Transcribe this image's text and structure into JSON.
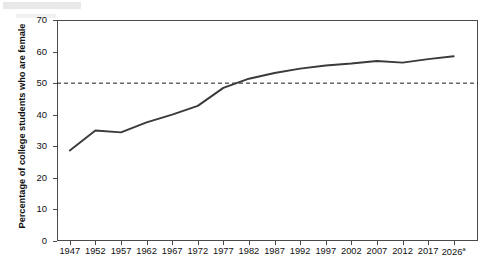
{
  "figure": {
    "background": "#ffffff",
    "axis_color": "#4a4a4a",
    "line_color": "#3a3a3a",
    "reference_line_color": "#1a1a1a"
  },
  "chart_data": {
    "type": "line",
    "title": "",
    "xlabel": "",
    "ylabel": "Percentage of college students who are female",
    "ylim": [
      0,
      70
    ],
    "ytick_values": [
      0,
      10,
      20,
      30,
      40,
      50,
      60,
      70
    ],
    "ytick_labels": [
      "0",
      "10",
      "20",
      "30",
      "40",
      "50",
      "60",
      "70"
    ],
    "xtick_labels": [
      "1947",
      "1952",
      "1957",
      "1962",
      "1967",
      "1972",
      "1977",
      "1982",
      "1987",
      "1992",
      "1997",
      "2002",
      "2007",
      "2012",
      "2017",
      "2026"
    ],
    "xtick_last_superscript": "a",
    "grid": false,
    "legend": "none",
    "categories": [
      1947,
      1952,
      1957,
      1962,
      1967,
      1972,
      1977,
      1982,
      1987,
      1992,
      1997,
      2002,
      2007,
      2012,
      2017,
      2026
    ],
    "values": [
      28.7,
      35.0,
      34.4,
      37.6,
      40.0,
      42.8,
      48.5,
      51.4,
      53.2,
      54.6,
      55.6,
      56.2,
      57.0,
      56.5,
      57.6,
      58.5
    ],
    "series": [
      {
        "name": "Percentage of college students who are female",
        "values": [
          28.7,
          35.0,
          34.4,
          37.6,
          40.0,
          42.8,
          48.5,
          51.4,
          53.2,
          54.6,
          55.6,
          56.2,
          57.0,
          56.5,
          57.6,
          58.5
        ]
      }
    ],
    "annotations": [
      {
        "type": "horizontal-reference-line",
        "value": 50,
        "style": "dashed",
        "label": ""
      }
    ]
  }
}
